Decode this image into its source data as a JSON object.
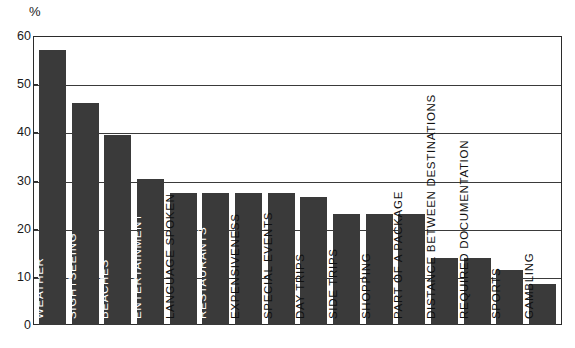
{
  "chart_data": {
    "type": "bar",
    "title": "",
    "subtitle": "",
    "xlabel": "",
    "ylabel": "%",
    "unit_label": "%",
    "ylim": [
      0,
      60
    ],
    "yticks": [
      0,
      10,
      20,
      30,
      40,
      50,
      60
    ],
    "ytick_labels": [
      "0",
      "10",
      "20",
      "30",
      "40",
      "50",
      "60"
    ],
    "grid": true,
    "grid_axis": "y",
    "legend": false,
    "legend_position": "none",
    "orientation": "vertical",
    "bar_color": "#3a3a3a",
    "axis_color": "#2b2b2b",
    "background_color": "#ffffff",
    "categories": [
      "WEATHER",
      "SIGHTSEEING",
      "BEACHES",
      "ENTERTAINMENT",
      "LANGUAGE SPOKEN",
      "RESTAURANTS",
      "EXPENSIVENESS",
      "SPECIAL EVENTS",
      "DAY TRIPS",
      "SIDE TRIPS",
      "SHOPPING",
      "PART OF A PACKAGE",
      "DISTANCE BETWEEN DESTINATIONS",
      "REQUIRED DOCUMENTATION",
      "SPORTS",
      "GAMBLING"
    ],
    "values": [
      57,
      46,
      39.5,
      30.3,
      27.5,
      27.5,
      27.5,
      27.5,
      26.5,
      23,
      23,
      23,
      14,
      14,
      11.5,
      8.5
    ],
    "label_placement": [
      "inside",
      "inside",
      "inside",
      "inside",
      "outside",
      "inside",
      "outside",
      "outside",
      "outside",
      "outside",
      "outside",
      "outside",
      "outside",
      "outside",
      "outside",
      "outside"
    ]
  }
}
